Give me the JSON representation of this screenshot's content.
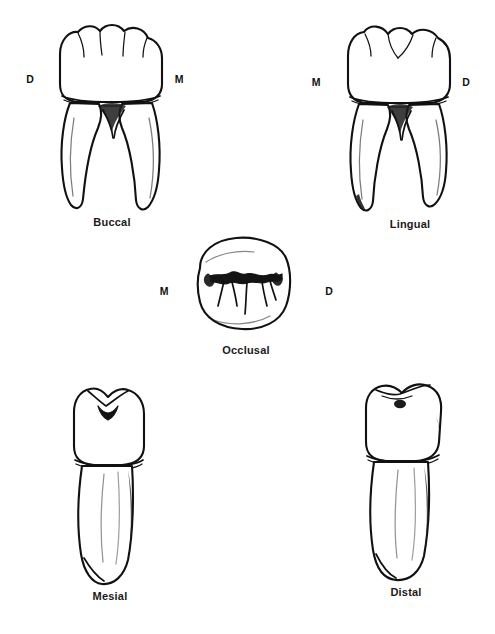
{
  "plate": {
    "title": "Mandibular molar — five anatomical views",
    "background_color": "#ffffff",
    "ink_color": "#111111",
    "width": 495,
    "height": 634
  },
  "views": [
    {
      "id": "buccal",
      "label": "Buccal",
      "left_marker": "D",
      "right_marker": "M",
      "marker_meaning_left": "Distal",
      "marker_meaning_right": "Mesial"
    },
    {
      "id": "lingual",
      "label": "Lingual",
      "left_marker": "M",
      "right_marker": "D",
      "marker_meaning_left": "Mesial",
      "marker_meaning_right": "Distal"
    },
    {
      "id": "occlusal",
      "label": "Occlusal",
      "left_marker": "M",
      "right_marker": "D",
      "marker_meaning_left": "Mesial",
      "marker_meaning_right": "Distal"
    },
    {
      "id": "mesial",
      "label": "Mesial",
      "left_marker": "",
      "right_marker": ""
    },
    {
      "id": "distal",
      "label": "Distal",
      "left_marker": "",
      "right_marker": ""
    }
  ]
}
